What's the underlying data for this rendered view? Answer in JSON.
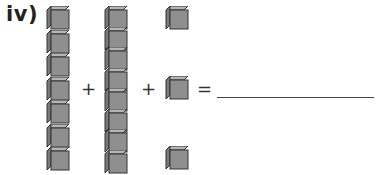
{
  "question": {
    "label": "iv)",
    "columns": [
      {
        "name": "column-1",
        "cube_count": 7
      },
      {
        "name": "column-2",
        "cube_count": 8
      },
      {
        "name": "column-3",
        "cube_count": 3,
        "spaced": true
      }
    ],
    "operators": {
      "plus_1": "+",
      "plus_2": "+",
      "equals": "="
    },
    "answer": ""
  },
  "colors": {
    "cube_front": "#8f8f8f",
    "cube_top": "#b5b5b5",
    "cube_side": "#7a7a7a",
    "cube_edge": "#333333"
  }
}
